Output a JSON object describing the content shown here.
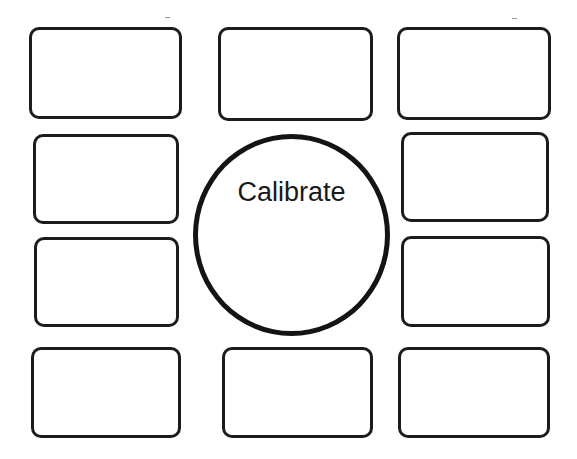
{
  "diagram": {
    "center": {
      "label": "Calibrate",
      "shape": "circle",
      "stroke_color": "#141414"
    },
    "boxes": [
      {
        "id": "top-left",
        "label": ""
      },
      {
        "id": "top-center",
        "label": ""
      },
      {
        "id": "top-right",
        "label": ""
      },
      {
        "id": "middle-left-upper",
        "label": ""
      },
      {
        "id": "middle-left-lower",
        "label": ""
      },
      {
        "id": "middle-right-upper",
        "label": ""
      },
      {
        "id": "middle-right-lower",
        "label": ""
      },
      {
        "id": "bottom-left",
        "label": ""
      },
      {
        "id": "bottom-center",
        "label": ""
      },
      {
        "id": "bottom-right",
        "label": ""
      }
    ],
    "box_stroke_color": "#1c1c1c",
    "background_color": "#ffffff"
  }
}
